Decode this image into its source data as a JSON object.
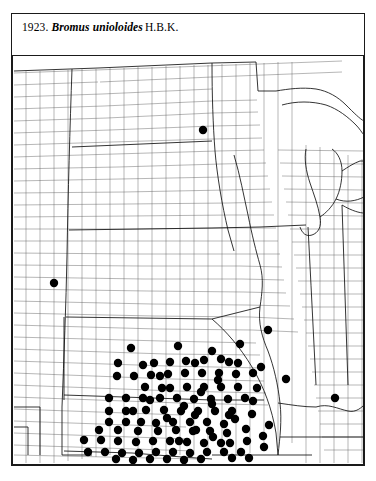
{
  "plate": {
    "number": "1923.",
    "taxon_name": "Bromus unioloides",
    "authority": "H.B.K."
  },
  "map": {
    "type": "county-dot-distribution-map",
    "region": "Central and Eastern United States",
    "dot_color": "#000000",
    "line_color": "#4a4a4a",
    "state_line_color": "#111111",
    "background_color": "#ffffff",
    "dot_radius": 4.2,
    "dot_count": 118,
    "states_shown": [
      "Montana",
      "North Dakota",
      "South Dakota",
      "Minnesota",
      "Wisconsin",
      "Michigan",
      "Wyoming",
      "Nebraska",
      "Iowa",
      "Illinois",
      "Indiana",
      "Ohio",
      "Colorado",
      "Kansas",
      "Missouri",
      "Kentucky",
      "West Virginia",
      "New Mexico",
      "Oklahoma",
      "Arkansas",
      "Tennessee",
      "Texas",
      "Louisiana",
      "Mississippi",
      "Pennsylvania",
      "New York"
    ],
    "dots": [
      [
        203,
        130
      ],
      [
        54,
        283
      ],
      [
        268,
        330
      ],
      [
        131,
        348
      ],
      [
        178,
        346
      ],
      [
        118,
        363
      ],
      [
        154,
        363
      ],
      [
        170,
        362
      ],
      [
        186,
        361
      ],
      [
        204,
        360
      ],
      [
        221,
        359
      ],
      [
        238,
        363
      ],
      [
        117,
        376
      ],
      [
        134,
        376
      ],
      [
        151,
        375
      ],
      [
        168,
        374
      ],
      [
        185,
        373
      ],
      [
        202,
        373
      ],
      [
        219,
        373
      ],
      [
        236,
        374
      ],
      [
        253,
        373
      ],
      [
        170,
        388
      ],
      [
        187,
        387
      ],
      [
        204,
        387
      ],
      [
        221,
        387
      ],
      [
        238,
        387
      ],
      [
        109,
        398
      ],
      [
        126,
        398
      ],
      [
        143,
        398
      ],
      [
        160,
        398
      ],
      [
        177,
        398
      ],
      [
        194,
        399
      ],
      [
        211,
        399
      ],
      [
        228,
        399
      ],
      [
        245,
        398
      ],
      [
        109,
        411
      ],
      [
        126,
        411
      ],
      [
        146,
        410
      ],
      [
        164,
        410
      ],
      [
        181,
        411
      ],
      [
        198,
        411
      ],
      [
        215,
        411
      ],
      [
        232,
        411
      ],
      [
        109,
        422
      ],
      [
        126,
        422
      ],
      [
        141,
        422
      ],
      [
        156,
        423
      ],
      [
        173,
        422
      ],
      [
        190,
        422
      ],
      [
        207,
        422
      ],
      [
        224,
        424
      ],
      [
        99,
        430
      ],
      [
        118,
        430
      ],
      [
        138,
        431
      ],
      [
        158,
        431
      ],
      [
        176,
        430
      ],
      [
        193,
        431
      ],
      [
        210,
        431
      ],
      [
        227,
        433
      ],
      [
        84,
        440
      ],
      [
        101,
        440
      ],
      [
        118,
        441
      ],
      [
        136,
        442
      ],
      [
        153,
        441
      ],
      [
        170,
        441
      ],
      [
        187,
        442
      ],
      [
        204,
        443
      ],
      [
        221,
        443
      ],
      [
        88,
        452
      ],
      [
        105,
        452
      ],
      [
        122,
        453
      ],
      [
        139,
        453
      ],
      [
        156,
        452
      ],
      [
        173,
        452
      ],
      [
        190,
        453
      ],
      [
        207,
        452
      ],
      [
        224,
        452
      ],
      [
        241,
        452
      ],
      [
        116,
        459
      ],
      [
        133,
        460
      ],
      [
        150,
        459
      ],
      [
        167,
        459
      ],
      [
        184,
        460
      ],
      [
        201,
        459
      ],
      [
        232,
        458
      ],
      [
        249,
        458
      ],
      [
        261,
        367
      ],
      [
        253,
        401
      ],
      [
        286,
        379
      ],
      [
        335,
        398
      ],
      [
        240,
        344
      ],
      [
        257,
        388
      ],
      [
        246,
        429
      ],
      [
        263,
        436
      ],
      [
        229,
        415
      ],
      [
        212,
        404
      ],
      [
        195,
        415
      ],
      [
        162,
        388
      ],
      [
        145,
        387
      ],
      [
        179,
        441
      ],
      [
        196,
        430
      ],
      [
        213,
        437
      ],
      [
        230,
        443
      ],
      [
        247,
        441
      ],
      [
        264,
        447
      ],
      [
        143,
        365
      ],
      [
        160,
        376
      ],
      [
        229,
        362
      ],
      [
        212,
        351
      ],
      [
        195,
        363
      ],
      [
        133,
        411
      ],
      [
        150,
        400
      ],
      [
        167,
        418
      ],
      [
        184,
        406
      ],
      [
        201,
        392
      ],
      [
        218,
        380
      ],
      [
        235,
        419
      ],
      [
        252,
        414
      ],
      [
        269,
        425
      ]
    ]
  }
}
